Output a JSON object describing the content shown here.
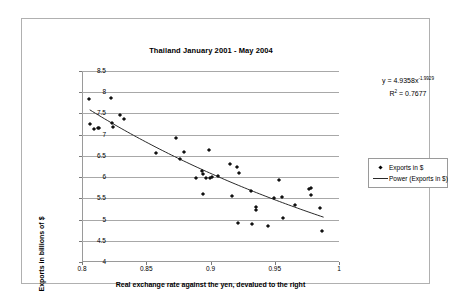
{
  "chart_data": {
    "type": "scatter",
    "title": "Thailand January 2001 - May 2004",
    "xlabel": "Real exchange rate against the yen, devalued to the right",
    "ylabel": "Exports in billions of $",
    "xlim": [
      0.8,
      1.0
    ],
    "ylim": [
      4.0,
      8.5
    ],
    "xticks": [
      "0.8",
      "0.85",
      "0.9",
      "0.95",
      "1"
    ],
    "xtick_values": [
      0.8,
      0.85,
      0.9,
      0.95,
      1.0
    ],
    "yticks": [
      "4",
      "4.5",
      "5",
      "5.5",
      "6",
      "6.5",
      "7",
      "7.5",
      "8",
      "8.5"
    ],
    "ytick_values": [
      4,
      4.5,
      5,
      5.5,
      6,
      6.5,
      7,
      7.5,
      8,
      8.5
    ],
    "grid": "horizontal",
    "legend_position": "right",
    "legend": [
      "Exports in $",
      "Power (Exports in $)"
    ],
    "annotations": {
      "equation_prefix": "y = 4.9358x",
      "equation_exponent": "-1.9929",
      "r_squared_prefix": "R",
      "r_squared_sup": "2",
      "r_squared_value": " = 0.7677"
    },
    "series": [
      {
        "name": "Exports in $",
        "marker": "diamond",
        "color": "#111111",
        "points": [
          [
            0.8055,
            7.84
          ],
          [
            0.8065,
            7.25
          ],
          [
            0.8095,
            7.13
          ],
          [
            0.8125,
            7.15
          ],
          [
            0.8135,
            7.15
          ],
          [
            0.8225,
            7.86
          ],
          [
            0.8235,
            7.28
          ],
          [
            0.8245,
            7.18
          ],
          [
            0.8295,
            7.47
          ],
          [
            0.8325,
            7.36
          ],
          [
            0.8575,
            6.56
          ],
          [
            0.8735,
            6.91
          ],
          [
            0.8765,
            6.43
          ],
          [
            0.8795,
            6.6
          ],
          [
            0.8885,
            5.98
          ],
          [
            0.8935,
            6.14
          ],
          [
            0.8945,
            6.07
          ],
          [
            0.8945,
            5.6
          ],
          [
            0.8965,
            5.99
          ],
          [
            0.8985,
            6.63
          ],
          [
            0.8995,
            5.99
          ],
          [
            0.9015,
            6.0
          ],
          [
            0.9055,
            6.02
          ],
          [
            0.9155,
            6.3
          ],
          [
            0.9165,
            5.56
          ],
          [
            0.9205,
            6.24
          ],
          [
            0.9215,
            4.93
          ],
          [
            0.9225,
            6.1
          ],
          [
            0.9315,
            5.68
          ],
          [
            0.9325,
            4.9
          ],
          [
            0.9355,
            5.3
          ],
          [
            0.9355,
            5.22
          ],
          [
            0.9445,
            4.84
          ],
          [
            0.9495,
            5.51
          ],
          [
            0.9535,
            5.94
          ],
          [
            0.9555,
            5.53
          ],
          [
            0.9565,
            5.03
          ],
          [
            0.9655,
            5.35
          ],
          [
            0.9765,
            5.73
          ],
          [
            0.9785,
            5.74
          ],
          [
            0.9785,
            5.57
          ],
          [
            0.9855,
            5.28
          ],
          [
            0.9865,
            4.72
          ]
        ]
      },
      {
        "name": "Power (Exports in $)",
        "marker": "line",
        "color": "#2a2a2a",
        "type": "power",
        "coefficient": 4.9358,
        "exponent": -1.9929,
        "x_range": [
          0.806,
          0.988
        ]
      }
    ]
  }
}
